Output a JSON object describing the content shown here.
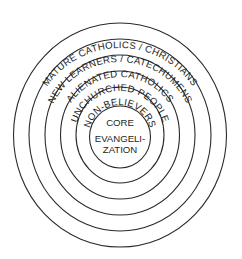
{
  "diagram": {
    "type": "concentric-circles",
    "center": {
      "x": 120,
      "y": 136
    },
    "rings": [
      {
        "label": "MATURE CATHOLICS / CHRISTIANS",
        "radius": 111
      },
      {
        "label": "NEW LEARNERS / CATECHUMENS",
        "radius": 95
      },
      {
        "label": "ALIENATED CATHOLICS",
        "radius": 79
      },
      {
        "label": "UNCHURCHED PEOPLE",
        "radius": 63
      },
      {
        "label": "NON-BELIEVERS",
        "radius": 47
      }
    ],
    "core": {
      "radius": 31,
      "line1": "CORE",
      "line2": "EVANGELI-",
      "line3": "ZATION"
    },
    "colors": {
      "stroke": "#2a2a2a",
      "text": "#1e1e1e",
      "background": "#ffffff"
    }
  }
}
